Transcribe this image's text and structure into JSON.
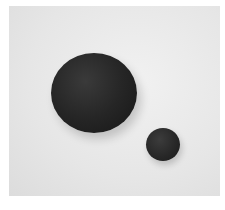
{
  "photo": {
    "subject": "two dark spherical balls on a light gray background",
    "background_color": "#e6e6e6",
    "border_color": "#ffffff",
    "objects": [
      {
        "name": "large-ball",
        "color": "#262626"
      },
      {
        "name": "small-ball",
        "color": "#282828"
      }
    ]
  }
}
